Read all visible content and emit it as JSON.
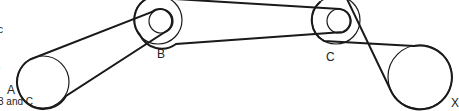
{
  "caption": {
    "lines": [
      "c",
      ".",
      "3 and C"
    ]
  },
  "pulleys": [
    {
      "id": "A",
      "label": "A",
      "cx": 43,
      "cy": 82,
      "r": 26,
      "inner_r": null,
      "label_x": 7,
      "label_y": 83
    },
    {
      "id": "B",
      "label": "B",
      "cx": 158,
      "cy": 20,
      "r": 24,
      "inner_r": 12,
      "label_x": 157,
      "label_y": 47
    },
    {
      "id": "C",
      "label": "C",
      "cx": 336,
      "cy": 20,
      "r": 24,
      "inner_r": 12,
      "label_x": 326,
      "label_y": 50
    },
    {
      "id": "X",
      "label": "X",
      "cx": 420,
      "cy": 77,
      "r": 32,
      "inner_r": null,
      "label_x": 451,
      "label_y": 96
    }
  ],
  "style": {
    "stroke": "#1a1a1a",
    "belt_width": 2,
    "circle_width": 1.2
  }
}
